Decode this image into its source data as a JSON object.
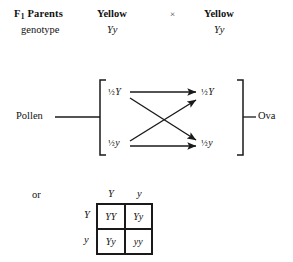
{
  "figure": {
    "header": {
      "row_label_bold": "F",
      "row_label_bold_sub": "1",
      "row_label_bold_rest": " Parents",
      "row_label_second": "genotype",
      "parent1_phenotype": "Yellow",
      "parent1_genotype": "Yy",
      "cross_symbol": "×",
      "parent2_phenotype": "Yellow",
      "parent2_genotype": "Yy"
    },
    "gamete_diagram": {
      "left_source_label": "Pollen",
      "right_source_label": "Ova",
      "pollen_gametes": [
        {
          "fraction": "½",
          "allele": "Y"
        },
        {
          "fraction": "½",
          "allele": "y"
        }
      ],
      "ova_gametes": [
        {
          "fraction": "½",
          "allele": "Y"
        },
        {
          "fraction": "½",
          "allele": "y"
        }
      ],
      "arrow_count": 4,
      "arrow_description": [
        "pollen-half-Y to ova-half-Y (horizontal)",
        "pollen-half-Y to ova-half-y (diagonal down)",
        "pollen-half-y to ova-half-Y (diagonal up)",
        "pollen-half-y to ova-half-y (horizontal)"
      ]
    },
    "alternative": {
      "or_label": "or",
      "punnett_square": {
        "column_headers": [
          "Y",
          "y"
        ],
        "row_headers": [
          "Y",
          "y"
        ],
        "cells": [
          [
            "YY",
            "Yy"
          ],
          [
            "Yy",
            "yy"
          ]
        ]
      }
    },
    "colors": {
      "background": "#ffffff",
      "ink": "#111111",
      "rule": "#1a1a1a"
    }
  }
}
